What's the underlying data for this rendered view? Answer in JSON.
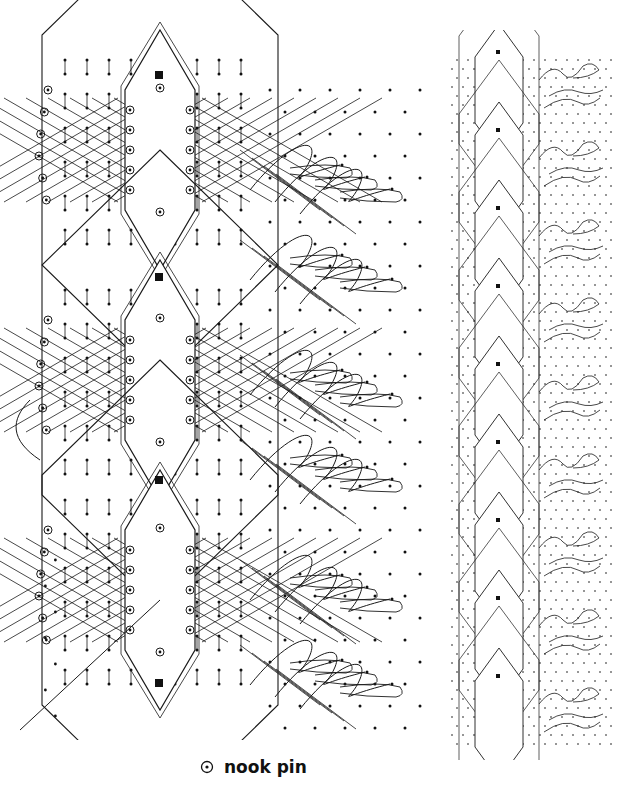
{
  "diagram": {
    "type": "lace-pricking",
    "colors": {
      "line": "#1a1a1a",
      "pin": "#111111",
      "background": "#ffffff"
    },
    "detail_panel": {
      "motif_count": 3,
      "motif_centers_y": [
        150,
        380,
        590
      ],
      "motif_center_x": 160,
      "square_markers_y": [
        75,
        277,
        480,
        683
      ],
      "fan_rows_y": [
        180,
        270,
        385,
        470,
        590,
        675
      ]
    },
    "repeat_strip": {
      "motif_count": 9,
      "start_y": 20,
      "spacing_y": 78
    }
  },
  "legend": {
    "icon": "nook-pin-icon",
    "label": "nook pin"
  }
}
